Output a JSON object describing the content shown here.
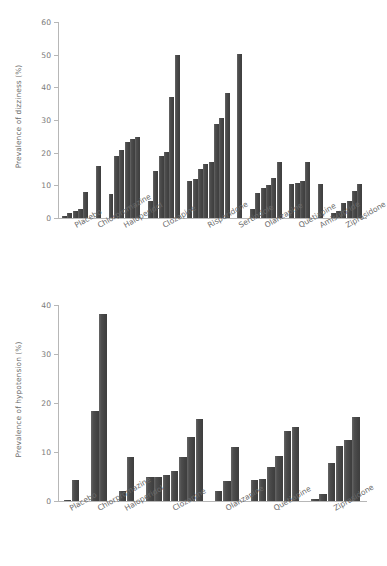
{
  "figure": {
    "bar_color": "#4a4a4a",
    "axis_color": "#b7b7b7",
    "background": "#ffffff"
  },
  "chart_data": [
    {
      "type": "bar",
      "title": "",
      "xlabel": "",
      "ylabel": "Prevalence of dizziness (%)",
      "ylim": [
        0,
        60
      ],
      "yticks": [
        0,
        10,
        20,
        30,
        40,
        50,
        60
      ],
      "grid": false,
      "legend": "none",
      "categories": [
        "Placebo",
        "Chlorpromazine",
        "Haloperidol",
        "Clozapine",
        "Risperidone",
        "Sertindole",
        "Olanzapine",
        "Quetiapine",
        "Amisulpride",
        "Ziprasidone"
      ],
      "groups": [
        {
          "name": "Placebo",
          "values": [
            0.6,
            1.4,
            2.3,
            2.7,
            8.1
          ]
        },
        {
          "name": "Chlorpromazine",
          "values": [
            16.0
          ]
        },
        {
          "name": "Haloperidol",
          "values": [
            7.2,
            19.1,
            20.9,
            23.2,
            24.3,
            24.8
          ]
        },
        {
          "name": "Clozapine",
          "values": [
            5.1,
            14.4,
            19.0,
            20.2,
            37.0,
            50.0
          ]
        },
        {
          "name": "Risperidone",
          "values": [
            11.3,
            11.8,
            15.0,
            16.4,
            17.0,
            28.7,
            30.6,
            38.2
          ]
        },
        {
          "name": "Sertindole",
          "values": [
            50.1
          ]
        },
        {
          "name": "Olanzapine",
          "values": [
            2.7,
            7.8,
            9.2,
            10.2,
            12.3,
            17.3
          ]
        },
        {
          "name": "Quetiapine",
          "values": [
            10.3,
            10.7,
            11.3,
            17.0
          ]
        },
        {
          "name": "Amisulpride",
          "values": [
            10.5
          ]
        },
        {
          "name": "Ziprasidone",
          "values": [
            1.5,
            2.0,
            4.7,
            5.2,
            8.2,
            10.3
          ]
        }
      ]
    },
    {
      "type": "bar",
      "title": "",
      "xlabel": "",
      "ylabel": "Prevalence of hypotension (%)",
      "ylim": [
        0,
        40
      ],
      "yticks": [
        0,
        10,
        20,
        30,
        40
      ],
      "grid": false,
      "legend": "none",
      "categories": [
        "Placebo",
        "Chlorpromazine",
        "Haloperidol",
        "Clozapine",
        "Olanzapine",
        "Quetiapine",
        "Ziprasidone"
      ],
      "groups": [
        {
          "name": "Placebo",
          "values": [
            0.3,
            4.2
          ]
        },
        {
          "name": "Chlorpromazine",
          "values": [
            18.3,
            38.2
          ]
        },
        {
          "name": "Haloperidol",
          "values": [
            2.0,
            8.9
          ]
        },
        {
          "name": "Clozapine",
          "values": [
            4.9,
            5.0,
            5.4,
            6.1,
            9.0,
            13.1,
            16.8
          ]
        },
        {
          "name": "Olanzapine",
          "values": [
            2.0,
            4.0,
            11.0
          ]
        },
        {
          "name": "Quetiapine",
          "values": [
            4.3,
            4.4,
            7.0,
            9.1,
            14.2,
            15.1
          ]
        },
        {
          "name": "Ziprasidone",
          "values": [
            0.4,
            1.4,
            7.8,
            11.2,
            12.4,
            17.2
          ]
        }
      ]
    }
  ]
}
